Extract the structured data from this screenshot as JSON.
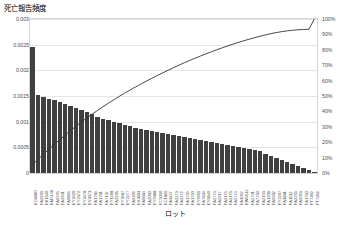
{
  "chart": {
    "title": "死亡報告頻度",
    "x_axis_title": "ロット"
  },
  "chart_data": {
    "type": "bar",
    "title": "死亡報告頻度",
    "subtitle": "",
    "xlabel": "ロット",
    "ylabel": "死亡報告頻度",
    "y2label": "",
    "ylim": [
      0,
      0.003
    ],
    "y2lim": [
      0,
      1.0
    ],
    "grid": true,
    "legend": false,
    "legend_position": "none",
    "ytick_labels": [
      "0.003",
      "0.0025",
      "0.002",
      "0.0015",
      "0.001",
      "0.0005",
      "0"
    ],
    "ytick_values": [
      0.003,
      0.0025,
      0.002,
      0.0015,
      0.001,
      0.0005,
      0
    ],
    "y2tick_labels": [
      "100%",
      "90%",
      "80%",
      "70%",
      "60%",
      "50%",
      "40%",
      "30%",
      "20%",
      "10%",
      "0%"
    ],
    "y2tick_values": [
      1.0,
      0.9,
      0.8,
      0.7,
      0.6,
      0.5,
      0.4,
      0.3,
      0.2,
      0.1,
      0
    ],
    "categories": [
      "EC8080",
      "FA2903",
      "EK1540",
      "EM7446",
      "FA0795",
      "FA2901",
      "FA0899",
      "EY3420",
      "EY2372",
      "EY3478",
      "EV3073",
      "FA1789",
      "FA1781",
      "FA7137",
      "EY1208",
      "FA2906",
      "EY3987",
      "EY2277",
      "FA9309",
      "EX3833",
      "FA0684",
      "FA2060",
      "EY9388",
      "FC5090",
      "EC1809",
      "FA3427",
      "FA2273",
      "FA2272",
      "FA1799",
      "FA1790",
      "EY9999",
      "FA7834",
      "EY6649",
      "FA2774",
      "FA2917",
      "FA2175",
      "FA2176",
      "FA2774",
      "FA3092",
      "EW5512",
      "FA2701",
      "FA7760",
      "FA2193",
      "FA1208",
      "FA9982",
      "EY2207",
      "FA3881",
      "FA1132",
      "FA2255",
      "FA9093",
      "FA1760",
      "FT7282",
      "FT7282"
    ],
    "series": [
      {
        "name": "死亡報告頻度",
        "type": "bar",
        "axis": "left",
        "color": "#404040",
        "values": [
          0.00246,
          0.00152,
          0.00148,
          0.00145,
          0.00142,
          0.00138,
          0.00134,
          0.0013,
          0.00126,
          0.00122,
          0.00118,
          0.00114,
          0.0011,
          0.00106,
          0.00103,
          0.001,
          0.00097,
          0.00094,
          0.00091,
          0.00088,
          0.00086,
          0.00084,
          0.00082,
          0.0008,
          0.00078,
          0.00076,
          0.00074,
          0.00072,
          0.0007,
          0.00068,
          0.00066,
          0.00064,
          0.00062,
          0.0006,
          0.00058,
          0.00056,
          0.00054,
          0.00052,
          0.0005,
          0.00048,
          0.00046,
          0.00044,
          0.00042,
          0.00038,
          0.00034,
          0.0003,
          0.00026,
          0.00022,
          0.00018,
          0.00014,
          0.0001,
          6e-05,
          2e-05
        ]
      },
      {
        "name": "累積割合",
        "type": "line",
        "axis": "right",
        "color": "#333333",
        "values": [
          0.055,
          0.089,
          0.122,
          0.154,
          0.186,
          0.217,
          0.247,
          0.276,
          0.304,
          0.331,
          0.357,
          0.383,
          0.407,
          0.431,
          0.454,
          0.476,
          0.498,
          0.519,
          0.539,
          0.559,
          0.578,
          0.597,
          0.615,
          0.633,
          0.65,
          0.667,
          0.684,
          0.7,
          0.716,
          0.731,
          0.746,
          0.76,
          0.774,
          0.787,
          0.8,
          0.813,
          0.825,
          0.837,
          0.848,
          0.859,
          0.869,
          0.879,
          0.888,
          0.897,
          0.905,
          0.912,
          0.918,
          0.923,
          0.927,
          0.93,
          0.932,
          0.933,
          1.0
        ]
      }
    ]
  }
}
